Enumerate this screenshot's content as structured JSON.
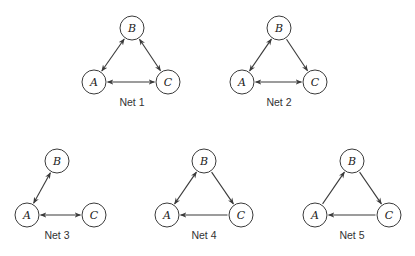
{
  "figure": {
    "node_radius": 12,
    "colors": {
      "stroke": "#3a3a3a",
      "fill": "#ffffff",
      "text": "#222222"
    },
    "networks": [
      {
        "label": "Net 1",
        "label_pos": [
          132,
          106
        ],
        "nodes": [
          {
            "id": "A",
            "x": 94,
            "y": 82
          },
          {
            "id": "B",
            "x": 132,
            "y": 28
          },
          {
            "id": "C",
            "x": 168,
            "y": 82
          }
        ],
        "edges": [
          {
            "from": "A",
            "to": "B",
            "type": "bidirectional"
          },
          {
            "from": "B",
            "to": "C",
            "type": "bidirectional"
          },
          {
            "from": "A",
            "to": "C",
            "type": "bidirectional"
          }
        ]
      },
      {
        "label": "Net 2",
        "label_pos": [
          279,
          106
        ],
        "nodes": [
          {
            "id": "A",
            "x": 242,
            "y": 82
          },
          {
            "id": "B",
            "x": 279,
            "y": 28
          },
          {
            "id": "C",
            "x": 315,
            "y": 82
          }
        ],
        "edges": [
          {
            "from": "A",
            "to": "B",
            "type": "bidirectional"
          },
          {
            "from": "B",
            "to": "C",
            "type": "directed"
          },
          {
            "from": "A",
            "to": "C",
            "type": "bidirectional"
          }
        ]
      },
      {
        "label": "Net 3",
        "label_pos": [
          57,
          239
        ],
        "nodes": [
          {
            "id": "A",
            "x": 27,
            "y": 215
          },
          {
            "id": "B",
            "x": 57,
            "y": 161
          },
          {
            "id": "C",
            "x": 94,
            "y": 215
          }
        ],
        "edges": [
          {
            "from": "A",
            "to": "B",
            "type": "bidirectional"
          },
          {
            "from": "A",
            "to": "C",
            "type": "bidirectional"
          }
        ]
      },
      {
        "label": "Net 4",
        "label_pos": [
          204,
          239
        ],
        "nodes": [
          {
            "id": "A",
            "x": 167,
            "y": 215
          },
          {
            "id": "B",
            "x": 204,
            "y": 161
          },
          {
            "id": "C",
            "x": 241,
            "y": 215
          }
        ],
        "edges": [
          {
            "from": "A",
            "to": "B",
            "type": "bidirectional"
          },
          {
            "from": "B",
            "to": "C",
            "type": "directed"
          },
          {
            "from": "C",
            "to": "A",
            "type": "directed"
          }
        ]
      },
      {
        "label": "Net 5",
        "label_pos": [
          352,
          239
        ],
        "nodes": [
          {
            "id": "A",
            "x": 315,
            "y": 215
          },
          {
            "id": "B",
            "x": 352,
            "y": 161
          },
          {
            "id": "C",
            "x": 389,
            "y": 215
          }
        ],
        "edges": [
          {
            "from": "A",
            "to": "B",
            "type": "directed"
          },
          {
            "from": "B",
            "to": "C",
            "type": "directed"
          },
          {
            "from": "C",
            "to": "A",
            "type": "directed"
          }
        ]
      }
    ]
  }
}
